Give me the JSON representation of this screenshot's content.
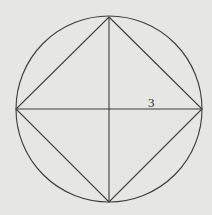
{
  "diagram": {
    "circle": {
      "cx": 109,
      "cy": 109,
      "r": 93
    },
    "square_vertices": {
      "top": [
        109,
        17
      ],
      "right": [
        202,
        109
      ],
      "bottom": [
        109,
        202
      ],
      "left": [
        16,
        109
      ]
    },
    "labels": [
      {
        "text": "3",
        "x": 148,
        "y": 107,
        "refers_to": "radius (half of horizontal diagonal)"
      }
    ],
    "colors": {
      "background": "#e6e6e4",
      "stroke": "#3a3a3a"
    }
  }
}
